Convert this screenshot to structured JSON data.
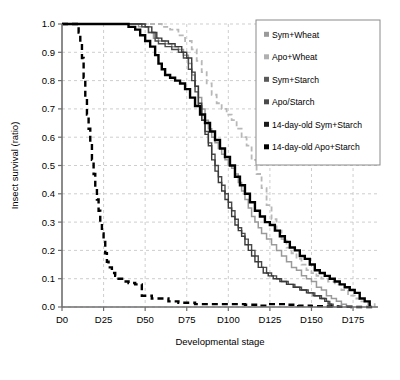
{
  "chart_data": {
    "type": "line",
    "title": "",
    "xlabel": "Developmental stage",
    "ylabel": "Insect survival (ratio)",
    "xlim": [
      0,
      190
    ],
    "ylim": [
      0.0,
      1.0
    ],
    "grid": true,
    "legend_position": "top-right",
    "xticks": [
      0,
      25,
      50,
      75,
      100,
      125,
      150,
      175
    ],
    "xticklabels": [
      "D0",
      "D25",
      "D50",
      "D75",
      "D100",
      "D125",
      "D150",
      "D175"
    ],
    "yticks": [
      0.0,
      0.1,
      0.2,
      0.3,
      0.4,
      0.5,
      0.6,
      0.7,
      0.8,
      0.9,
      1.0
    ],
    "yticklabels": [
      "0.0",
      "0.1",
      "0.2",
      "0.3",
      "0.4",
      "0.5",
      "0.6",
      "0.7",
      "0.8",
      "0.9",
      "1.0"
    ],
    "series": [
      {
        "name": "Sym+Wheat",
        "color": "#9a9a9a",
        "style": "solid",
        "width": 1.5,
        "points": [
          [
            0,
            1.0
          ],
          [
            40,
            1.0
          ],
          [
            46,
            0.99
          ],
          [
            52,
            0.97
          ],
          [
            55,
            0.95
          ],
          [
            58,
            0.94
          ],
          [
            62,
            0.93
          ],
          [
            66,
            0.92
          ],
          [
            70,
            0.91
          ],
          [
            73,
            0.89
          ],
          [
            76,
            0.86
          ],
          [
            78,
            0.82
          ],
          [
            80,
            0.78
          ],
          [
            82,
            0.74
          ],
          [
            84,
            0.7
          ],
          [
            86,
            0.66
          ],
          [
            88,
            0.63
          ],
          [
            90,
            0.6
          ],
          [
            92,
            0.58
          ],
          [
            94,
            0.56
          ],
          [
            96,
            0.54
          ],
          [
            98,
            0.52
          ],
          [
            100,
            0.5
          ],
          [
            102,
            0.49
          ],
          [
            104,
            0.47
          ],
          [
            106,
            0.44
          ],
          [
            108,
            0.41
          ],
          [
            110,
            0.38
          ],
          [
            112,
            0.35
          ],
          [
            114,
            0.32
          ],
          [
            116,
            0.3
          ],
          [
            118,
            0.28
          ],
          [
            120,
            0.26
          ],
          [
            123,
            0.24
          ],
          [
            126,
            0.22
          ],
          [
            129,
            0.2
          ],
          [
            132,
            0.18
          ],
          [
            135,
            0.16
          ],
          [
            138,
            0.14
          ],
          [
            141,
            0.13
          ],
          [
            144,
            0.11
          ],
          [
            147,
            0.1
          ],
          [
            150,
            0.09
          ],
          [
            153,
            0.07
          ],
          [
            156,
            0.06
          ],
          [
            159,
            0.04
          ],
          [
            162,
            0.03
          ],
          [
            165,
            0.02
          ],
          [
            168,
            0.01
          ],
          [
            171,
            0.0
          ]
        ]
      },
      {
        "name": "Apo+Wheat",
        "color": "#b8b8b8",
        "style": "dashed",
        "width": 1.8,
        "points": [
          [
            0,
            1.0
          ],
          [
            55,
            1.0
          ],
          [
            60,
            0.99
          ],
          [
            65,
            0.98
          ],
          [
            70,
            0.96
          ],
          [
            74,
            0.94
          ],
          [
            78,
            0.91
          ],
          [
            81,
            0.87
          ],
          [
            84,
            0.83
          ],
          [
            87,
            0.79
          ],
          [
            90,
            0.75
          ],
          [
            93,
            0.72
          ],
          [
            96,
            0.7
          ],
          [
            99,
            0.68
          ],
          [
            102,
            0.66
          ],
          [
            105,
            0.63
          ],
          [
            108,
            0.6
          ],
          [
            111,
            0.57
          ],
          [
            114,
            0.52
          ],
          [
            117,
            0.47
          ],
          [
            120,
            0.42
          ],
          [
            123,
            0.36
          ],
          [
            126,
            0.31
          ],
          [
            129,
            0.27
          ],
          [
            132,
            0.24
          ],
          [
            135,
            0.21
          ],
          [
            138,
            0.19
          ],
          [
            141,
            0.17
          ],
          [
            144,
            0.15
          ],
          [
            147,
            0.13
          ],
          [
            150,
            0.12
          ],
          [
            153,
            0.11
          ],
          [
            156,
            0.1
          ],
          [
            160,
            0.09
          ],
          [
            164,
            0.08
          ],
          [
            168,
            0.06
          ],
          [
            172,
            0.04
          ],
          [
            176,
            0.03
          ],
          [
            180,
            0.02
          ],
          [
            184,
            0.01
          ],
          [
            188,
            0.0
          ]
        ]
      },
      {
        "name": "Sym+Starch",
        "color": "#4a4a4a",
        "style": "solid",
        "width": 1.4,
        "points": [
          [
            0,
            1.0
          ],
          [
            42,
            1.0
          ],
          [
            48,
            0.99
          ],
          [
            52,
            0.97
          ],
          [
            56,
            0.94
          ],
          [
            58,
            0.93
          ],
          [
            62,
            0.92
          ],
          [
            66,
            0.91
          ],
          [
            70,
            0.9
          ],
          [
            73,
            0.88
          ],
          [
            76,
            0.84
          ],
          [
            78,
            0.8
          ],
          [
            80,
            0.76
          ],
          [
            82,
            0.71
          ],
          [
            84,
            0.66
          ],
          [
            86,
            0.62
          ],
          [
            88,
            0.58
          ],
          [
            90,
            0.54
          ],
          [
            92,
            0.5
          ],
          [
            94,
            0.46
          ],
          [
            96,
            0.43
          ],
          [
            98,
            0.4
          ],
          [
            100,
            0.37
          ],
          [
            102,
            0.34
          ],
          [
            104,
            0.31
          ],
          [
            106,
            0.28
          ],
          [
            108,
            0.26
          ],
          [
            110,
            0.24
          ],
          [
            112,
            0.22
          ],
          [
            114,
            0.2
          ],
          [
            116,
            0.18
          ],
          [
            118,
            0.16
          ],
          [
            120,
            0.14
          ],
          [
            123,
            0.12
          ],
          [
            126,
            0.11
          ],
          [
            129,
            0.1
          ],
          [
            132,
            0.09
          ],
          [
            136,
            0.08
          ],
          [
            140,
            0.07
          ],
          [
            144,
            0.06
          ],
          [
            148,
            0.05
          ],
          [
            152,
            0.04
          ],
          [
            156,
            0.03
          ],
          [
            159,
            0.02
          ],
          [
            161,
            0.01
          ],
          [
            163,
            0.0
          ]
        ]
      },
      {
        "name": "Apo/Starch",
        "color": "#3a3a3a",
        "style": "solid",
        "width": 1.4,
        "points": [
          [
            0,
            1.0
          ],
          [
            44,
            1.0
          ],
          [
            50,
            0.99
          ],
          [
            54,
            0.97
          ],
          [
            57,
            0.95
          ],
          [
            60,
            0.94
          ],
          [
            64,
            0.93
          ],
          [
            68,
            0.92
          ],
          [
            72,
            0.9
          ],
          [
            75,
            0.88
          ],
          [
            78,
            0.83
          ],
          [
            80,
            0.78
          ],
          [
            82,
            0.72
          ],
          [
            84,
            0.66
          ],
          [
            86,
            0.61
          ],
          [
            88,
            0.57
          ],
          [
            90,
            0.52
          ],
          [
            92,
            0.48
          ],
          [
            94,
            0.44
          ],
          [
            96,
            0.41
          ],
          [
            98,
            0.38
          ],
          [
            100,
            0.35
          ],
          [
            102,
            0.32
          ],
          [
            104,
            0.29
          ],
          [
            106,
            0.27
          ],
          [
            108,
            0.25
          ],
          [
            110,
            0.22
          ],
          [
            112,
            0.2
          ],
          [
            114,
            0.18
          ],
          [
            116,
            0.16
          ],
          [
            118,
            0.14
          ],
          [
            121,
            0.12
          ],
          [
            124,
            0.11
          ],
          [
            127,
            0.1
          ],
          [
            131,
            0.09
          ],
          [
            135,
            0.08
          ],
          [
            139,
            0.07
          ],
          [
            143,
            0.06
          ],
          [
            147,
            0.05
          ],
          [
            151,
            0.04
          ],
          [
            155,
            0.03
          ],
          [
            158,
            0.02
          ],
          [
            160,
            0.01
          ],
          [
            162,
            0.0
          ]
        ]
      },
      {
        "name": "14-day-old Sym+Starch",
        "color": "#000000",
        "style": "solid",
        "width": 2.4,
        "points": [
          [
            0,
            1.0
          ],
          [
            36,
            1.0
          ],
          [
            40,
            0.99
          ],
          [
            44,
            0.98
          ],
          [
            47,
            0.96
          ],
          [
            50,
            0.94
          ],
          [
            53,
            0.92
          ],
          [
            56,
            0.89
          ],
          [
            58,
            0.86
          ],
          [
            60,
            0.84
          ],
          [
            62,
            0.82
          ],
          [
            65,
            0.81
          ],
          [
            68,
            0.8
          ],
          [
            71,
            0.79
          ],
          [
            74,
            0.77
          ],
          [
            77,
            0.74
          ],
          [
            80,
            0.71
          ],
          [
            83,
            0.68
          ],
          [
            86,
            0.65
          ],
          [
            89,
            0.62
          ],
          [
            92,
            0.59
          ],
          [
            95,
            0.56
          ],
          [
            98,
            0.53
          ],
          [
            101,
            0.5
          ],
          [
            104,
            0.46
          ],
          [
            107,
            0.43
          ],
          [
            110,
            0.4
          ],
          [
            113,
            0.37
          ],
          [
            116,
            0.34
          ],
          [
            119,
            0.32
          ],
          [
            122,
            0.3
          ],
          [
            125,
            0.29
          ],
          [
            128,
            0.27
          ],
          [
            131,
            0.25
          ],
          [
            134,
            0.23
          ],
          [
            137,
            0.21
          ],
          [
            140,
            0.2
          ],
          [
            143,
            0.18
          ],
          [
            146,
            0.17
          ],
          [
            149,
            0.15
          ],
          [
            152,
            0.13
          ],
          [
            155,
            0.12
          ],
          [
            158,
            0.11
          ],
          [
            161,
            0.1
          ],
          [
            164,
            0.09
          ],
          [
            167,
            0.08
          ],
          [
            170,
            0.07
          ],
          [
            173,
            0.06
          ],
          [
            176,
            0.05
          ],
          [
            179,
            0.03
          ],
          [
            182,
            0.02
          ],
          [
            185,
            0.0
          ]
        ]
      },
      {
        "name": "14-day-old Apo+Starch",
        "color": "#000000",
        "style": "dashed",
        "width": 2.4,
        "points": [
          [
            0,
            1.0
          ],
          [
            9,
            1.0
          ],
          [
            10,
            0.97
          ],
          [
            11,
            0.93
          ],
          [
            12,
            0.88
          ],
          [
            13,
            0.81
          ],
          [
            14,
            0.74
          ],
          [
            15,
            0.68
          ],
          [
            16,
            0.63
          ],
          [
            17,
            0.58
          ],
          [
            18,
            0.52
          ],
          [
            19,
            0.47
          ],
          [
            20,
            0.42
          ],
          [
            21,
            0.38
          ],
          [
            22,
            0.34
          ],
          [
            23,
            0.3
          ],
          [
            24,
            0.26
          ],
          [
            25,
            0.23
          ],
          [
            26,
            0.19
          ],
          [
            27,
            0.16
          ],
          [
            28,
            0.14
          ],
          [
            30,
            0.12
          ],
          [
            32,
            0.11
          ],
          [
            34,
            0.1
          ],
          [
            37,
            0.09
          ],
          [
            40,
            0.085
          ],
          [
            44,
            0.08
          ],
          [
            48,
            0.04
          ],
          [
            54,
            0.03
          ],
          [
            60,
            0.03
          ],
          [
            64,
            0.02
          ],
          [
            70,
            0.015
          ],
          [
            80,
            0.01
          ],
          [
            90,
            0.01
          ],
          [
            100,
            0.01
          ],
          [
            110,
            0.008
          ],
          [
            118,
            0.005
          ],
          [
            124,
            0.01
          ],
          [
            130,
            0.01
          ],
          [
            136,
            0.008
          ],
          [
            142,
            0.005
          ],
          [
            150,
            0.003
          ],
          [
            158,
            0.002
          ],
          [
            166,
            0.001
          ],
          [
            174,
            0.0
          ],
          [
            188,
            0.0
          ]
        ]
      }
    ]
  },
  "legend": {
    "entries": [
      {
        "label": "Sym+Wheat",
        "swatch": "#9a9a9a"
      },
      {
        "label": "Apo+Wheat",
        "swatch": "#b0b0b0"
      },
      {
        "label": "Sym+Starch",
        "swatch": "#5a5a5a"
      },
      {
        "label": "Apo/Starch",
        "swatch": "#4a4a4a"
      },
      {
        "label": "14-day-old Sym+Starch",
        "swatch": "#1a1a1a"
      },
      {
        "label": "14-day-old Apo+Starch",
        "swatch": "#000000"
      }
    ]
  },
  "caption": {
    "text": ""
  }
}
